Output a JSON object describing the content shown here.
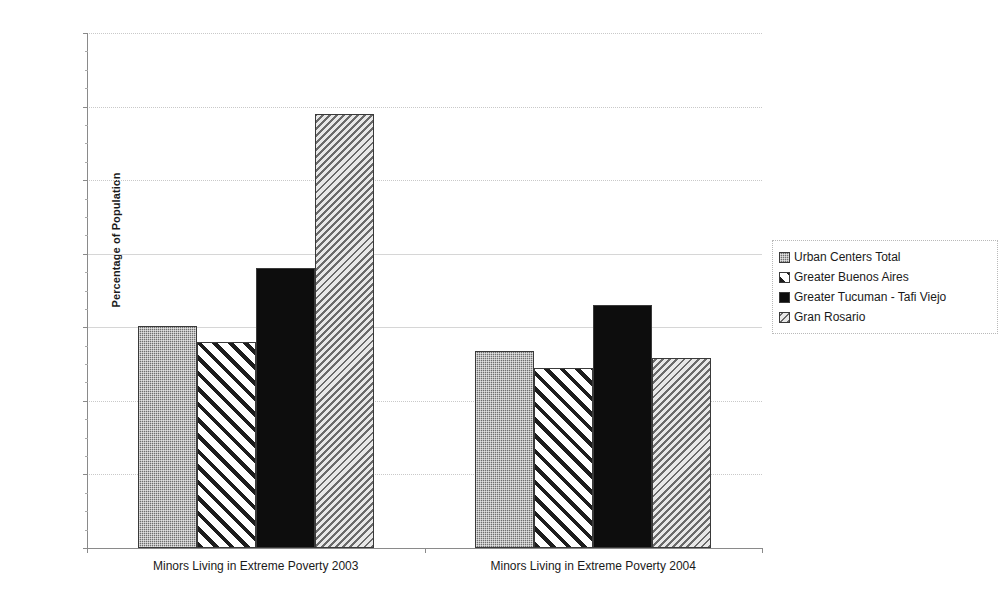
{
  "chart_data": {
    "type": "bar",
    "title": "",
    "xlabel": "",
    "ylabel": "Percentage of Population",
    "ylim": [
      0,
      70
    ],
    "ytick_labels": [
      "0%",
      "10%",
      "20%",
      "30%",
      "40%",
      "50%",
      "60%",
      "70%"
    ],
    "ytick_values": [
      0,
      10,
      20,
      30,
      40,
      50,
      60,
      70
    ],
    "grid": true,
    "grid_axis": "y",
    "legend_position": "right",
    "categories": [
      "Minors Living in Extreme Poverty 2003",
      "Minors Living in Extreme Poverty 2004"
    ],
    "series": [
      {
        "name": "Urban Centers Total",
        "pattern": "dots-gray",
        "values": [
          30.2,
          26.8
        ]
      },
      {
        "name": "Greater Buenos Aires",
        "pattern": "diagonal-forward",
        "values": [
          28.0,
          24.5
        ]
      },
      {
        "name": "Greater Tucuman - Tafi Viejo",
        "pattern": "solid-black",
        "values": [
          38.0,
          33.0
        ]
      },
      {
        "name": "Gran Rosario",
        "pattern": "diagonal-backward-gray",
        "values": [
          59.0,
          25.8
        ]
      }
    ]
  },
  "colors": {
    "axis": "#8a8a8a",
    "gridline": "#c9c9c9",
    "bar_outline": "#3a3a3a",
    "series_1": "#6f6f6f",
    "series_2": "#1d1d1d",
    "series_3": "#0d0d0d",
    "series_4": "#6a6a6a",
    "background": "#ffffff"
  }
}
